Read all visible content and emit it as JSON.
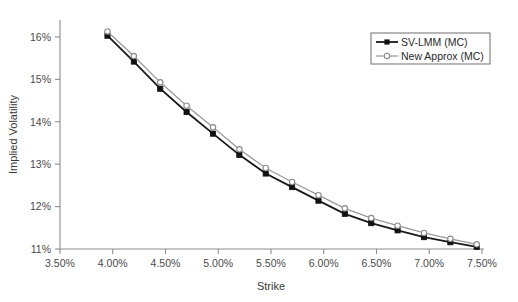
{
  "chart_data": {
    "type": "line",
    "title": "",
    "subtitle": "",
    "xlabel": "Strike",
    "ylabel": "Implied Volatility",
    "xlim": [
      3.5,
      7.5
    ],
    "ylim": [
      11.0,
      16.4
    ],
    "grid": false,
    "legend_position": "top-right",
    "x_tick_labels": [
      "3.50%",
      "4.00%",
      "4.50%",
      "5.00%",
      "5.50%",
      "6.00%",
      "6.50%",
      "7.00%",
      "7.50%"
    ],
    "x_tick_values": [
      3.5,
      4.0,
      4.5,
      5.0,
      5.5,
      6.0,
      6.5,
      7.0,
      7.5
    ],
    "y_tick_labels": [
      "11%",
      "12%",
      "13%",
      "14%",
      "15%",
      "16%"
    ],
    "y_tick_values": [
      11,
      12,
      13,
      14,
      15,
      16
    ],
    "x": [
      3.95,
      4.2,
      4.45,
      4.7,
      4.95,
      5.2,
      5.45,
      5.7,
      5.95,
      6.2,
      6.45,
      6.7,
      6.95,
      7.2,
      7.45
    ],
    "series": [
      {
        "name": "SV-LMM (MC)",
        "marker": "filled-square",
        "color": "#1a1a1a",
        "values": [
          16.03,
          15.42,
          14.78,
          14.23,
          13.72,
          13.22,
          12.78,
          12.46,
          12.14,
          11.83,
          11.61,
          11.44,
          11.28,
          11.16,
          11.05
        ]
      },
      {
        "name": "New Approx (MC)",
        "marker": "open-circle",
        "color": "#9a9a9a",
        "values": [
          16.13,
          15.55,
          14.93,
          14.38,
          13.87,
          13.35,
          12.91,
          12.58,
          12.27,
          11.96,
          11.73,
          11.55,
          11.38,
          11.24,
          11.11
        ]
      }
    ]
  },
  "legend": {
    "entries": [
      {
        "label": "SV-LMM (MC)"
      },
      {
        "label": "New Approx (MC)"
      }
    ]
  }
}
